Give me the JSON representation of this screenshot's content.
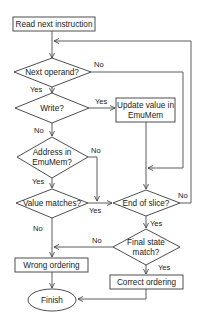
{
  "diagram": {
    "type": "flowchart",
    "nodes": {
      "read": {
        "label": "Read next instruction",
        "shape": "rectangle"
      },
      "next_operand": {
        "label": "Next operand?",
        "shape": "diamond"
      },
      "write": {
        "label": "Write?",
        "shape": "diamond"
      },
      "update": {
        "line1": "Update value in",
        "line2": "EmuMem",
        "shape": "rectangle"
      },
      "address": {
        "line1": "Address in",
        "line2": "EmuMem?",
        "shape": "diamond"
      },
      "value_matches": {
        "label": "Value matches?",
        "shape": "diamond"
      },
      "end_slice": {
        "label": "End of slice?",
        "shape": "diamond"
      },
      "final_state": {
        "line1": "Final state",
        "line2": "match?",
        "shape": "diamond"
      },
      "wrong": {
        "label": "Wrong ordering",
        "shape": "rectangle"
      },
      "correct": {
        "label": "Correct ordering",
        "shape": "rectangle"
      },
      "finish": {
        "label": "Finish",
        "shape": "ellipse"
      }
    },
    "edges": {
      "next_operand_no": "No",
      "next_operand_yes": "Yes",
      "write_yes": "Yes",
      "write_no": "No",
      "address_no": "No",
      "address_yes": "Yes",
      "value_matches_yes": "Yes",
      "value_matches_no": "No",
      "end_slice_no": "No",
      "end_slice_yes": "Yes",
      "final_state_no": "No",
      "final_state_yes": "Yes"
    },
    "colors": {
      "stroke": "#3a3a3a",
      "background": "#ffffff",
      "text": "#1a1a1a"
    }
  }
}
